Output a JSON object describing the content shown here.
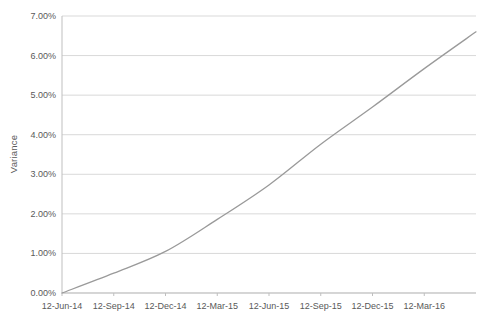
{
  "style": {
    "background": "#ffffff",
    "grid_color": "#d9d9d9",
    "axis_color": "#bfbfbf",
    "text_color": "#595959",
    "line_color": "#9a9a9a"
  },
  "chart_data": {
    "type": "line",
    "title": "",
    "xlabel": "",
    "ylabel": "Variance",
    "legend_position": "none",
    "grid": "horizontal",
    "ylim": [
      0,
      7
    ],
    "xlim": [
      0,
      8
    ],
    "y_tick_values": [
      0,
      1,
      2,
      3,
      4,
      5,
      6,
      7
    ],
    "y_tick_labels": [
      "0.00%",
      "1.00%",
      "2.00%",
      "3.00%",
      "4.00%",
      "5.00%",
      "6.00%",
      "7.00%"
    ],
    "x_tick_values": [
      0,
      1,
      2,
      3,
      4,
      5,
      6,
      7
    ],
    "x_tick_labels": [
      "12-Jun-14",
      "12-Sep-14",
      "12-Dec-14",
      "12-Mar-15",
      "12-Jun-15",
      "12-Sep-15",
      "12-Dec-15",
      "12-Mar-16"
    ],
    "series": [
      {
        "name": "Variance",
        "x": [
          0,
          1,
          2,
          3,
          4,
          5,
          6,
          7,
          8
        ],
        "values_percent": [
          0.0,
          0.5,
          1.05,
          1.86,
          2.73,
          3.76,
          4.7,
          5.67,
          6.6
        ]
      }
    ]
  }
}
